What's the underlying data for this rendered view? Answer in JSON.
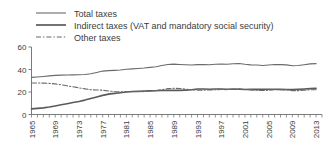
{
  "chart_data": {
    "type": "line",
    "title": "",
    "xlabel": "",
    "ylabel": "",
    "xlim": [
      1965,
      2014
    ],
    "ylim": [
      0,
      60
    ],
    "yticks": [
      0,
      20,
      40,
      60
    ],
    "ytick_labels": [
      "0",
      "20",
      "40",
      "60"
    ],
    "xticks": [
      1965,
      1969,
      1973,
      1977,
      1981,
      1985,
      1989,
      1993,
      1997,
      2001,
      2005,
      2009,
      2013
    ],
    "xtick_labels": [
      "1965",
      "1969",
      "1973",
      "1977",
      "1981",
      "1985",
      "1989",
      "1993",
      "1997",
      "2001",
      "2005",
      "2009",
      "2013"
    ],
    "xtick_rotation": 90,
    "minor_xticks_every": 1,
    "grid": false,
    "legend_position": "top",
    "line_color": "#6a6a6a",
    "x": [
      1965,
      1966,
      1967,
      1968,
      1969,
      1970,
      1971,
      1972,
      1973,
      1974,
      1975,
      1976,
      1977,
      1978,
      1979,
      1980,
      1981,
      1982,
      1983,
      1984,
      1985,
      1986,
      1987,
      1988,
      1989,
      1990,
      1991,
      1992,
      1993,
      1994,
      1995,
      1996,
      1997,
      1998,
      1999,
      2000,
      2001,
      2002,
      2003,
      2004,
      2005,
      2006,
      2007,
      2008,
      2009,
      2010,
      2011,
      2012,
      2013
    ],
    "series": [
      {
        "name": "Total taxes",
        "style": "solid",
        "width": 1.1,
        "color": "#6a6a6a",
        "values": [
          33.0,
          33.4,
          33.8,
          34.3,
          34.8,
          35.0,
          35.1,
          35.2,
          35.3,
          35.6,
          36.2,
          37.4,
          38.6,
          39.0,
          39.2,
          39.5,
          40.2,
          40.6,
          40.9,
          41.3,
          41.9,
          42.5,
          43.5,
          44.4,
          44.8,
          44.5,
          44.2,
          44.0,
          44.3,
          44.4,
          44.2,
          44.6,
          44.9,
          44.6,
          45.1,
          45.3,
          44.6,
          44.1,
          44.0,
          43.6,
          44.0,
          44.4,
          44.3,
          44.1,
          43.3,
          43.5,
          44.2,
          45.0,
          45.2
        ]
      },
      {
        "name": "Indirect taxes (VAT and mandatory social security)",
        "style": "solid",
        "width": 1.6,
        "color": "#5a5a5a",
        "values": [
          5.0,
          5.4,
          5.9,
          6.6,
          7.6,
          8.6,
          9.6,
          10.6,
          11.6,
          12.8,
          14.2,
          15.6,
          17.0,
          18.1,
          18.8,
          19.4,
          20.0,
          20.4,
          20.7,
          20.9,
          21.0,
          21.1,
          21.3,
          21.4,
          21.5,
          21.4,
          21.7,
          22.0,
          22.6,
          22.7,
          22.4,
          22.6,
          22.7,
          22.5,
          22.6,
          22.5,
          22.2,
          22.3,
          22.5,
          22.3,
          22.4,
          22.4,
          22.3,
          22.2,
          22.1,
          22.3,
          22.6,
          23.0,
          23.2
        ]
      },
      {
        "name": "Other taxes",
        "style": "dashdot",
        "width": 1.1,
        "color": "#6a6a6a",
        "values": [
          28.0,
          28.0,
          27.9,
          27.7,
          27.2,
          26.4,
          25.5,
          24.6,
          23.7,
          22.8,
          22.0,
          21.8,
          21.6,
          20.9,
          20.4,
          20.1,
          20.2,
          20.2,
          20.2,
          20.4,
          20.9,
          21.4,
          22.2,
          23.0,
          23.3,
          23.1,
          22.5,
          22.0,
          21.7,
          21.7,
          21.8,
          22.0,
          22.2,
          22.1,
          22.5,
          22.8,
          22.4,
          21.8,
          21.5,
          21.3,
          21.6,
          22.0,
          22.0,
          21.9,
          21.2,
          21.2,
          21.6,
          22.0,
          22.0
        ]
      }
    ]
  },
  "legend": {
    "items": [
      {
        "label": "Total taxes",
        "style": "solid-thin"
      },
      {
        "label": "Indirect taxes (VAT and mandatory social security)",
        "style": "solid-thick"
      },
      {
        "label": "Other taxes",
        "style": "dash-dot"
      }
    ]
  }
}
